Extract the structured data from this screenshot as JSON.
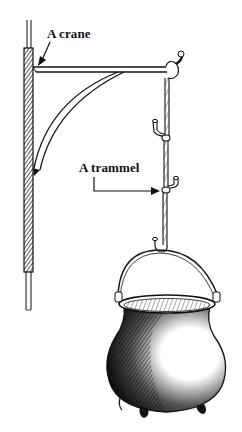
{
  "figure": {
    "labels": {
      "crane": "A crane",
      "trammel": "A trammel"
    },
    "colors": {
      "ink": "#111111",
      "background": "#ffffff"
    }
  }
}
